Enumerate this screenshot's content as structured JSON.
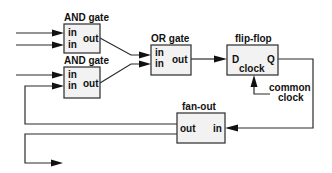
{
  "diagram": {
    "blocks": {
      "and1": {
        "title": "AND gate",
        "in_labels": [
          "in",
          "in"
        ],
        "out_label": "out"
      },
      "and2": {
        "title": "AND gate",
        "in_labels": [
          "in",
          "in"
        ],
        "out_label": "out"
      },
      "or": {
        "title": "OR gate",
        "in_labels": [
          "in",
          "in"
        ],
        "out_label": "out"
      },
      "flipflop": {
        "title": "flip-flop",
        "d_label": "D",
        "q_label": "Q",
        "clock_label": "clock"
      },
      "fanout": {
        "title": "fan-out",
        "out_label": "out",
        "in_label": "in"
      }
    },
    "annotations": {
      "common_clock_line1": "common",
      "common_clock_line2": "clock"
    },
    "colors": {
      "box_fill": "#f2f2f2",
      "stroke": "#2a2a2a"
    }
  }
}
